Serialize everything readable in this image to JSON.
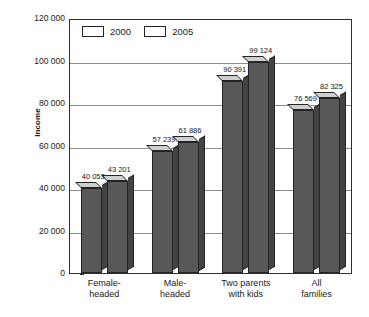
{
  "chart_data": {
    "type": "bar",
    "title": "",
    "xlabel": "",
    "ylabel": "Income",
    "categories": [
      "Female-headed",
      "Male-headed",
      "Two parents with kids",
      "All families"
    ],
    "category_lines": [
      [
        "Female-",
        "headed"
      ],
      [
        "Male-",
        "headed"
      ],
      [
        "Two parents",
        "with kids"
      ],
      [
        "All",
        "families"
      ]
    ],
    "series": [
      {
        "name": "2000",
        "values": [
          40053,
          43201,
          57239,
          61886
        ],
        "color": "#585858"
      },
      {
        "name": "2005",
        "values": [
          90391,
          99124,
          76569,
          82325
        ],
        "color": "#585858"
      }
    ],
    "groups": [
      {
        "category": "Female-headed",
        "bars": [
          {
            "series": "2000",
            "value": 40053,
            "label": "40 053"
          },
          {
            "series": "2005",
            "value": 43201,
            "label": "43 201"
          }
        ]
      },
      {
        "category": "Male-headed",
        "bars": [
          {
            "series": "2000",
            "value": 57239,
            "label": "57 239"
          },
          {
            "series": "2005",
            "value": 61886,
            "label": "61 886"
          }
        ]
      },
      {
        "category": "Two parents with kids",
        "bars": [
          {
            "series": "2000",
            "value": 90391,
            "label": "90 391"
          },
          {
            "series": "2005",
            "value": 99124,
            "label": "99 124"
          }
        ]
      },
      {
        "category": "All families",
        "bars": [
          {
            "series": "2000",
            "value": 76569,
            "label": "76 569"
          },
          {
            "series": "2005",
            "value": 82325,
            "label": "82 325"
          }
        ]
      }
    ],
    "ylim": [
      0,
      120000
    ],
    "ytick_values": [
      0,
      20000,
      40000,
      60000,
      80000,
      100000,
      120000
    ],
    "ytick_labels": [
      "0",
      "20 000",
      "40 000",
      "60 000",
      "80 000",
      "100 000",
      "120 000"
    ],
    "grid": "horizontal",
    "legend_position": "top-left-inside",
    "legend": [
      "2000",
      "2005"
    ],
    "thousands_separator": "space"
  },
  "colors": {
    "bar_front": "#585858",
    "bar_side": "#434343",
    "bar_top": "#cfcfcf",
    "outline": "#242424",
    "gridline": "#8c8c8c",
    "frame": "#2f2f2f",
    "background": "#ffffff",
    "text": "#1a1a1a"
  }
}
